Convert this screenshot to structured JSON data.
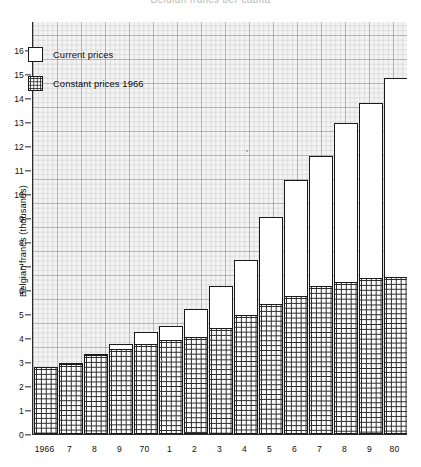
{
  "caption": "Belgian francs per capita",
  "chart_data": {
    "type": "bar",
    "subtype": "stacked-bar",
    "title": "",
    "xlabel": "",
    "ylabel": "Belgian francs (thousands)",
    "ylim": [
      0,
      17
    ],
    "ytick_step": 1,
    "yticks": [
      0,
      1,
      2,
      3,
      4,
      5,
      6,
      7,
      8,
      9,
      10,
      11,
      12,
      13,
      14,
      15,
      16
    ],
    "ytick_labels": [
      "0",
      "1",
      "2",
      "3",
      "4",
      "5",
      "6",
      "7",
      "8",
      "9",
      "10",
      "11",
      "12",
      "13",
      "14",
      "15",
      "16"
    ],
    "grid": true,
    "grid_minor": true,
    "legend_position": "top-left",
    "categories": [
      "1966",
      "7",
      "8",
      "9",
      "70",
      "1",
      "2",
      "3",
      "4",
      "5",
      "6",
      "7",
      "8",
      "9",
      "80"
    ],
    "series": [
      {
        "name": "Constant prices 1966",
        "fill": "grid-hatch",
        "values": [
          2.8,
          2.9,
          3.3,
          3.55,
          3.75,
          3.9,
          4.05,
          4.4,
          4.95,
          5.4,
          5.75,
          6.15,
          6.35,
          6.5,
          6.55
        ]
      },
      {
        "name": "Current prices",
        "fill": "white",
        "values": [
          2.8,
          2.95,
          3.35,
          3.75,
          4.25,
          4.5,
          5.2,
          6.15,
          7.25,
          9.05,
          10.6,
          11.6,
          12.95,
          13.8,
          14.85
        ]
      }
    ]
  },
  "legend": {
    "items": [
      {
        "label": "Current prices",
        "swatch": "white-box"
      },
      {
        "label": "Constant prices 1966",
        "swatch": "grid-hatch-box"
      }
    ]
  }
}
